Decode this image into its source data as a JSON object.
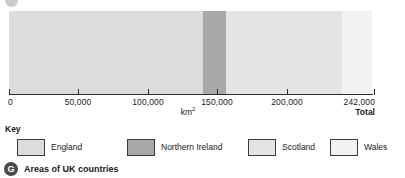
{
  "chart_data": {
    "type": "bar",
    "orientation": "horizontal",
    "stacked": true,
    "title": "Areas of UK countries",
    "xlabel": "km2",
    "ylabel": "",
    "xlim": [
      0,
      242000
    ],
    "grid": false,
    "legend_position": "bottom",
    "legend_title": "Key",
    "categories": [
      "England",
      "Northern Ireland",
      "Scotland",
      "Wales"
    ],
    "values": [
      130400,
      14100,
      78800,
      20800
    ],
    "total": 242000,
    "tick_values": [
      0,
      50000,
      100000,
      150000,
      200000,
      242000
    ],
    "tick_labels": [
      "0",
      "50,000",
      "100,000",
      "150,000",
      "200,000",
      "242,000"
    ],
    "series": [
      {
        "name": "England",
        "value": 130400,
        "color": "#dcdcdc"
      },
      {
        "name": "Northern Ireland",
        "value": 14100,
        "color": "#a8a8a8"
      },
      {
        "name": "Scotland",
        "value": 78800,
        "color": "#e4e4e4"
      },
      {
        "name": "Wales",
        "value": 20800,
        "color": "#f2f2f2"
      }
    ]
  },
  "axis": {
    "unit_base": "km",
    "unit_exponent": "2",
    "total_label": "Total",
    "ticks": [
      {
        "label": "0",
        "value": 0,
        "x": 9,
        "align": "first"
      },
      {
        "label": "50,000",
        "value": 50000,
        "x": 78,
        "align": "mid"
      },
      {
        "label": "100,000",
        "value": 100000,
        "x": 148,
        "align": "mid"
      },
      {
        "label": "150,000",
        "value": 150000,
        "x": 217,
        "align": "mid"
      },
      {
        "label": "200,000",
        "value": 200000,
        "x": 287,
        "align": "mid"
      },
      {
        "label": "242,000",
        "value": 242000,
        "x": 374,
        "align": "last"
      }
    ]
  },
  "bar": {
    "segments": [
      {
        "name": "England",
        "color": "#dcdcdc",
        "width_px": 194,
        "border": "none"
      },
      {
        "name": "Northern Ireland",
        "color": "#a8a8a8",
        "width_px": 23,
        "border": "none"
      },
      {
        "name": "Scotland",
        "color": "#e4e4e4",
        "width_px": 116,
        "border": "none"
      },
      {
        "name": "Wales",
        "color": "#f2f2f2",
        "width_px": 30,
        "border": "none"
      }
    ]
  },
  "key": {
    "title": "Key",
    "items": [
      {
        "label": "England",
        "color": "#dcdcdc",
        "left": 12
      },
      {
        "label": "Northern Ireland",
        "color": "#a8a8a8",
        "left": 122
      },
      {
        "label": "Scotland",
        "color": "#e4e4e4",
        "left": 243
      },
      {
        "label": "Wales",
        "color": "#f2f2f2",
        "left": 325
      }
    ]
  },
  "caption": {
    "badge": "G",
    "text": "Areas of UK countries"
  },
  "icons": {
    "top_partial": "circle-badge-clipped-icon"
  },
  "colors": {
    "england": "#dcdcdc",
    "northern_ireland": "#a8a8a8",
    "scotland": "#e4e4e4",
    "wales": "#f2f2f2",
    "axis": "#2b2b2b",
    "text": "#1a1a1a",
    "badge": "#4a4a4a"
  }
}
